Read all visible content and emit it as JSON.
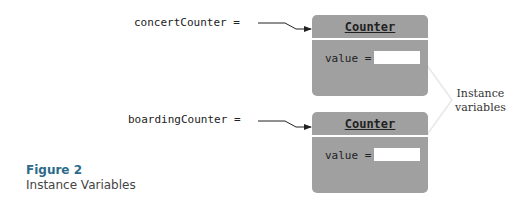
{
  "diagram": {
    "variables": [
      {
        "label": "concertCounter ="
      },
      {
        "label": "boardingCounter ="
      }
    ],
    "objects": [
      {
        "class_name": "Counter",
        "field_label": "value ="
      },
      {
        "class_name": "Counter",
        "field_label": "value ="
      }
    ],
    "annotation": {
      "line1": "Instance",
      "line2": "variables"
    }
  },
  "caption": {
    "title": "Figure 2",
    "subtitle": "Instance Variables"
  }
}
